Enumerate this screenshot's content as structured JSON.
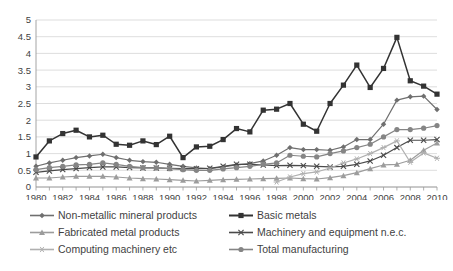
{
  "chart_data": {
    "type": "line",
    "title": "",
    "subtitle": "",
    "xlabel": "",
    "ylabel": "",
    "xlim": [
      1980,
      2010
    ],
    "ylim": [
      0,
      5
    ],
    "grid": true,
    "legend_position": "bottom",
    "y_ticks": [
      "0",
      "0.5",
      "1",
      "1.5",
      "2",
      "2.5",
      "3",
      "3.5",
      "4",
      "4.5",
      "5"
    ],
    "y_tick_values": [
      0,
      0.5,
      1,
      1.5,
      2,
      2.5,
      3,
      3.5,
      4,
      4.5,
      5
    ],
    "x": [
      1980,
      1981,
      1982,
      1983,
      1984,
      1985,
      1986,
      1987,
      1988,
      1989,
      1990,
      1991,
      1992,
      1993,
      1994,
      1995,
      1996,
      1997,
      1998,
      1999,
      2000,
      2001,
      2002,
      2003,
      2004,
      2005,
      2006,
      2007,
      2008,
      2009,
      2010
    ],
    "x_tick_labels": [
      "1980",
      "1982",
      "1984",
      "1986",
      "1988",
      "1990",
      "1992",
      "1994",
      "1996",
      "1998",
      "2000",
      "2002",
      "2004",
      "2006",
      "2008",
      "2010"
    ],
    "x_tick_values": [
      1980,
      1982,
      1984,
      1986,
      1988,
      1990,
      1992,
      1994,
      1996,
      1998,
      2000,
      2002,
      2004,
      2006,
      2008,
      2010
    ],
    "series": [
      {
        "name": "Non-metallic mineral products",
        "marker": "diamond",
        "color": "#6f6f6f",
        "values": [
          0.62,
          0.72,
          0.8,
          0.88,
          0.93,
          0.98,
          0.88,
          0.8,
          0.76,
          0.74,
          0.68,
          0.62,
          0.57,
          0.55,
          0.6,
          0.66,
          0.7,
          0.78,
          0.95,
          1.18,
          1.12,
          1.12,
          1.1,
          1.2,
          1.42,
          1.42,
          1.88,
          2.6,
          2.7,
          2.72,
          2.32
        ]
      },
      {
        "name": "Basic metals",
        "marker": "square",
        "color": "#333333",
        "values": [
          0.9,
          1.38,
          1.6,
          1.7,
          1.5,
          1.55,
          1.28,
          1.25,
          1.38,
          1.27,
          1.52,
          0.88,
          1.2,
          1.22,
          1.42,
          1.75,
          1.65,
          2.3,
          2.33,
          2.5,
          1.88,
          1.67,
          2.5,
          3.05,
          3.65,
          2.98,
          3.55,
          4.48,
          3.18,
          3.02,
          2.78
        ]
      },
      {
        "name": "Fabricated metal products",
        "marker": "triangle",
        "color": "#9c9c9c",
        "values": [
          0.27,
          0.27,
          0.3,
          0.32,
          0.32,
          0.32,
          0.3,
          0.27,
          0.25,
          0.24,
          0.22,
          0.2,
          0.18,
          0.2,
          0.22,
          0.23,
          0.24,
          0.25,
          0.26,
          0.27,
          0.25,
          0.24,
          0.28,
          0.34,
          0.43,
          0.55,
          0.66,
          0.68,
          0.8,
          1.1,
          1.32
        ]
      },
      {
        "name": "Machinery and equipment n.e.c.",
        "marker": "cross",
        "color": "#4a4a4a",
        "values": [
          0.44,
          0.48,
          0.52,
          0.55,
          0.58,
          0.6,
          0.6,
          0.58,
          0.57,
          0.57,
          0.56,
          0.55,
          0.55,
          0.56,
          0.62,
          0.68,
          0.68,
          0.66,
          0.64,
          0.65,
          0.64,
          0.62,
          0.6,
          0.62,
          0.68,
          0.78,
          0.95,
          1.18,
          1.4,
          1.4,
          1.42
        ]
      },
      {
        "name": "Computing machinery etc",
        "marker": "asterisk",
        "color": "#b0b0b0",
        "values": [
          null,
          null,
          null,
          null,
          null,
          null,
          null,
          null,
          null,
          null,
          null,
          null,
          null,
          null,
          null,
          null,
          null,
          null,
          0.15,
          0.3,
          0.4,
          0.45,
          0.57,
          0.72,
          0.84,
          1.0,
          1.18,
          1.38,
          0.74,
          1.02,
          0.86
        ]
      },
      {
        "name": "Total manufacturing",
        "marker": "circle",
        "color": "#858585",
        "values": [
          0.52,
          0.58,
          0.62,
          0.66,
          0.68,
          0.72,
          0.68,
          0.62,
          0.58,
          0.57,
          0.55,
          0.52,
          0.5,
          0.5,
          0.54,
          0.58,
          0.62,
          0.68,
          0.72,
          0.95,
          0.92,
          0.9,
          1.0,
          1.08,
          1.18,
          1.28,
          1.5,
          1.72,
          1.72,
          1.76,
          1.84
        ]
      }
    ]
  },
  "legend": {
    "items": [
      {
        "label": "Non-metallic mineral products",
        "marker": "diamond",
        "color": "#6f6f6f"
      },
      {
        "label": "Basic metals",
        "marker": "square",
        "color": "#333333"
      },
      {
        "label": "Fabricated metal products",
        "marker": "triangle",
        "color": "#9c9c9c"
      },
      {
        "label": "Machinery and equipment n.e.c.",
        "marker": "cross",
        "color": "#4a4a4a"
      },
      {
        "label": "Computing machinery etc",
        "marker": "asterisk",
        "color": "#b0b0b0"
      },
      {
        "label": "Total manufacturing",
        "marker": "circle",
        "color": "#858585"
      }
    ]
  },
  "colors": {
    "background": "#ffffff",
    "grid": "#d4d4d4",
    "axis": "#9a9a9a",
    "text": "#3f3f3f"
  }
}
